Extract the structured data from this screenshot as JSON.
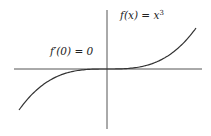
{
  "diagram": {
    "type": "function-plot",
    "function": "x^3",
    "labels": {
      "function_label_base": "f(x) = x",
      "function_label_exponent": "3",
      "derivative_label": "f′(0) = 0"
    },
    "x_range": [
      -1.5,
      1.5
    ],
    "colors": {
      "axis": "#555555",
      "curve": "#333333",
      "text": "#222222"
    }
  }
}
